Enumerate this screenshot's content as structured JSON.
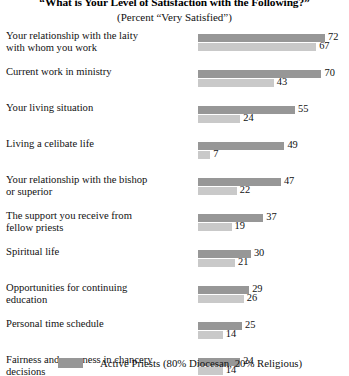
{
  "chart_data": {
    "type": "bar",
    "orientation": "horizontal",
    "title": "“What is Your Level of Satisfaction with the Following?”",
    "subtitle": "(Percent “Very Satisfied”)",
    "xlabel": "",
    "ylabel": "",
    "xlim": [
      0,
      72
    ],
    "grid": false,
    "legend_position": "bottom",
    "colors": {
      "series_a": "#979797",
      "series_b": "#c9c9c9"
    },
    "categories": [
      "Your relationship with the laity with whom you work",
      "Current work in ministry",
      "Your living situation",
      "Living a celibate life",
      "Your relationship with the bishop or superior",
      "The support you receive from fellow priests",
      "Spiritual life",
      "Opportunities for continuing education",
      "Personal time schedule",
      "Fairness and openness in chancery decisions"
    ],
    "series": [
      {
        "name": "Active Priests (80% Diocesan, 20% Religious)",
        "values": [
          72,
          70,
          55,
          49,
          47,
          37,
          30,
          29,
          25,
          24
        ]
      },
      {
        "name": "",
        "values": [
          67,
          43,
          24,
          7,
          22,
          19,
          21,
          26,
          14,
          14
        ]
      }
    ]
  },
  "rows": [
    {
      "label_line1": "Your relationship with the laity",
      "label_line2": "with whom you work",
      "value_a": 72,
      "value_b": 67
    },
    {
      "label_line1": "Current work in ministry",
      "label_line2": "",
      "value_a": 70,
      "value_b": 43
    },
    {
      "label_line1": "Your living situation",
      "label_line2": "",
      "value_a": 55,
      "value_b": 24
    },
    {
      "label_line1": "Living a celibate life",
      "label_line2": "",
      "value_a": 49,
      "value_b": 7
    },
    {
      "label_line1": "Your relationship with the bishop",
      "label_line2": "or superior",
      "value_a": 47,
      "value_b": 22
    },
    {
      "label_line1": "The support you receive from",
      "label_line2": "fellow priests",
      "value_a": 37,
      "value_b": 19
    },
    {
      "label_line1": "Spiritual life",
      "label_line2": "",
      "value_a": 30,
      "value_b": 21
    },
    {
      "label_line1": "Opportunities for continuing",
      "label_line2": "education",
      "value_a": 29,
      "value_b": 26
    },
    {
      "label_line1": "Personal time schedule",
      "label_line2": "",
      "value_a": 25,
      "value_b": 14
    },
    {
      "label_line1": "Fairness and openness in chancery",
      "label_line2": "decisions",
      "value_a": 24,
      "value_b": 14
    }
  ],
  "legend": {
    "label": "Active Priests (80% Diocesan, 20% Religious)"
  }
}
